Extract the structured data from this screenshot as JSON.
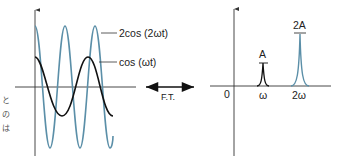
{
  "margin_text": {
    "chars": [
      "と",
      "の",
      "は"
    ]
  },
  "time_domain": {
    "curves": [
      {
        "name": "2cos(2ωt)",
        "label": "2cos (2ωt)",
        "amplitude": 2,
        "frequency_multiplier": 2,
        "color": "#5b8fa8"
      },
      {
        "name": "cos(ωt)",
        "label": "cos (ωt)",
        "amplitude": 1,
        "frequency_multiplier": 1,
        "color": "#111111"
      }
    ]
  },
  "transform": {
    "label": "F.T."
  },
  "frequency_domain": {
    "origin_label": "0",
    "ticks": [
      "ω",
      "2ω"
    ],
    "peaks": [
      {
        "position": "ω",
        "height_label": "A",
        "color": "#111111"
      },
      {
        "position": "2ω",
        "height_label": "2A",
        "color": "#5b8fa8"
      }
    ]
  },
  "colors": {
    "axis": "#333333",
    "blue_curve": "#5b8fa8",
    "black_curve": "#111111"
  }
}
